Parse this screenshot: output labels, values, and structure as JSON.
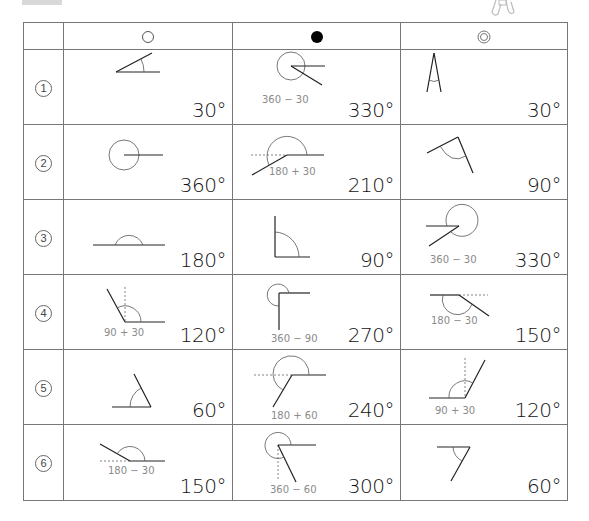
{
  "header": {
    "columns": [
      {
        "symbol": "open-circle",
        "label": "○"
      },
      {
        "symbol": "filled-circle",
        "label": "●"
      },
      {
        "symbol": "double-circle",
        "label": "◎"
      }
    ]
  },
  "rows": [
    {
      "num": "1",
      "cells": [
        {
          "answer": "30°",
          "hint": ""
        },
        {
          "answer": "330°",
          "hint": "360 − 30"
        },
        {
          "answer": "30°",
          "hint": ""
        }
      ]
    },
    {
      "num": "2",
      "cells": [
        {
          "answer": "360°",
          "hint": ""
        },
        {
          "answer": "210°",
          "hint": "180 + 30"
        },
        {
          "answer": "90°",
          "hint": ""
        }
      ]
    },
    {
      "num": "3",
      "cells": [
        {
          "answer": "180°",
          "hint": ""
        },
        {
          "answer": "90°",
          "hint": ""
        },
        {
          "answer": "330°",
          "hint": "360 − 30"
        }
      ]
    },
    {
      "num": "4",
      "cells": [
        {
          "answer": "120°",
          "hint": "90 + 30"
        },
        {
          "answer": "270°",
          "hint": "360 − 90"
        },
        {
          "answer": "150°",
          "hint": "180 − 30"
        }
      ]
    },
    {
      "num": "5",
      "cells": [
        {
          "answer": "60°",
          "hint": ""
        },
        {
          "answer": "240°",
          "hint": "180 + 60"
        },
        {
          "answer": "120°",
          "hint": "90 + 30"
        }
      ]
    },
    {
      "num": "6",
      "cells": [
        {
          "answer": "150°",
          "hint": "180 − 30"
        },
        {
          "answer": "300°",
          "hint": "360 − 60"
        },
        {
          "answer": "60°",
          "hint": ""
        }
      ]
    }
  ],
  "colors": {
    "grid": "#777777",
    "line": "#222222",
    "arc": "#555555",
    "dashed": "#666666",
    "hint": "#8a8a8a"
  }
}
